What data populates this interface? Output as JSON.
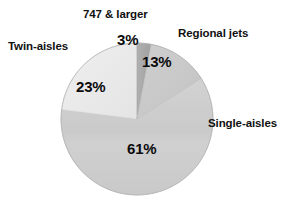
{
  "chart_data": {
    "type": "pie",
    "title": "",
    "subtitle": "",
    "xlabel": "",
    "ylabel": "",
    "legend_position": "none",
    "grid": false,
    "units": "percent",
    "start_angle_deg": 0,
    "direction": "clockwise",
    "categories": [
      "747 & larger",
      "Regional jets",
      "Single-aisles",
      "Twin-aisles"
    ],
    "values": [
      3,
      13,
      61,
      23
    ],
    "value_labels": [
      "3%",
      "13%",
      "61%",
      "23%"
    ],
    "slices": [
      {
        "label": "747 & larger",
        "value": 3,
        "value_label": "3%",
        "color": "#a8a8a8",
        "label_position": "top"
      },
      {
        "label": "Regional jets",
        "value": 13,
        "value_label": "13%",
        "color": "#c8c8c8",
        "label_position": "top-right"
      },
      {
        "label": "Single-aisles",
        "value": 61,
        "value_label": "61%",
        "color": "#cdcdcd",
        "label_position": "right"
      },
      {
        "label": "Twin-aisles",
        "value": 23,
        "value_label": "23%",
        "color": "#ebebeb",
        "label_position": "left"
      }
    ]
  },
  "labels": {
    "larger_747": "747 & larger",
    "regional_jets": "Regional jets",
    "twin_aisles": "Twin-aisles",
    "single_aisles": "Single-aisles"
  },
  "percentages": {
    "larger_747": "3%",
    "regional_jets": "13%",
    "twin_aisles": "23%",
    "single_aisles": "61%"
  },
  "colors": {
    "background": "#ffffff",
    "outline": "#9a9a9a",
    "text": "#111111",
    "slice_747": "#a8a8a8",
    "slice_regional": "#c8c8c8",
    "slice_single": "#cdcdcd",
    "slice_twin": "#ebebeb"
  }
}
